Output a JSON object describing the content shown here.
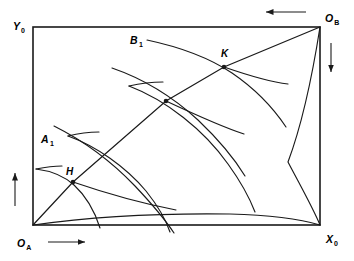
{
  "figure": {
    "type": "edgeworth-box-diagram",
    "title": "",
    "background_color": "#ffffff",
    "line_color": "#1a1a1a",
    "box": {
      "left": 33,
      "top": 27,
      "right": 320,
      "bottom": 225,
      "width": 287,
      "height": 198
    },
    "axis_labels": [
      {
        "id": "y-axis-label",
        "base": "Y",
        "sub": "0",
        "x": 13,
        "y": 27,
        "anchor": "start"
      },
      {
        "id": "ob-label",
        "base": "O",
        "sub": "B",
        "x": 325,
        "y": 22,
        "anchor": "start"
      },
      {
        "id": "oa-label",
        "base": "O",
        "sub": "A",
        "x": 17,
        "y": 247,
        "anchor": "start"
      },
      {
        "id": "x-axis-label",
        "base": "X",
        "sub": "0",
        "x": 326,
        "y": 243,
        "anchor": "start"
      }
    ],
    "point_labels": [
      {
        "id": "label-K",
        "text": "K",
        "x": 221,
        "y": 57
      },
      {
        "id": "label-H",
        "text": "H",
        "x": 66,
        "y": 175
      }
    ],
    "curve_labels": [
      {
        "id": "label-B1",
        "base": "B",
        "sub": "1",
        "x": 130,
        "y": 44
      },
      {
        "id": "label-A1",
        "base": "A",
        "sub": "1",
        "x": 41,
        "y": 143
      }
    ],
    "direction_arrows": [
      {
        "id": "arrow-top-left",
        "direction": "left",
        "x1": 305,
        "y1": 12,
        "x2": 265,
        "y2": 12
      },
      {
        "id": "arrow-right-down",
        "direction": "down",
        "x1": 331,
        "y1": 43,
        "x2": 331,
        "y2": 73
      },
      {
        "id": "arrow-left-up",
        "direction": "up",
        "x1": 15,
        "y1": 206,
        "x2": 15,
        "y2": 172
      },
      {
        "id": "arrow-bottom-right",
        "direction": "right",
        "x1": 48,
        "y1": 242,
        "x2": 86,
        "y2": 242
      }
    ],
    "equilibrium_points": [
      {
        "id": "point-H",
        "label": "H",
        "x": 73,
        "y": 182
      },
      {
        "id": "point-mid",
        "label": "",
        "x": 166,
        "y": 101
      },
      {
        "id": "point-K",
        "label": "K",
        "x": 224,
        "y": 67
      }
    ],
    "contract_curve": {
      "id": "contract-curve",
      "description": "contract curve from O_A to O_B through H, mid, K",
      "path": "M 33 225 L 73 182 L 166 101 L 224 67 L 320 27"
    },
    "isoquants_A": [
      {
        "id": "isoquant-A1",
        "label": "A1",
        "path": "M 37 170 C 55 175 68 180 78 191 C 88 202 96 214 101 228"
      },
      {
        "id": "isoquant-A2",
        "path": "M 70 137 C 100 147 128 167 147 192 C 158 206 166 220 170 232"
      },
      {
        "id": "isoquant-A3",
        "path": "M 130 87 C 170 101 208 131 232 166 C 244 183 253 200 258 214"
      }
    ],
    "isoquants_B": [
      {
        "id": "isoquant-B1",
        "label": "B1",
        "path": "M 148 40 C 185 49 215 62 240 80 C 262 96 280 114 295 135"
      },
      {
        "id": "isoquant-B2",
        "path": "M 116 69 C 150 84 180 104 202 126 C 220 144 235 162 246 180"
      },
      {
        "id": "isoquant-B3",
        "path": "M 57 128 C 88 145 117 167 139 189 C 155 205 168 221 176 233"
      }
    ],
    "envelope_curves": [
      {
        "id": "envelope-lower",
        "description": "lower boundary curve from O_A to X_0",
        "path": "M 33 225 C 90 217 160 213 230 214 C 270 215 300 219 320 225"
      },
      {
        "id": "envelope-upper",
        "description": "upper boundary curve from O_B to X_0",
        "path": "M 320 27 C 310 80 297 135 285 170 C 310 200 316 215 320 225"
      }
    ],
    "isoquant_tails": [
      {
        "id": "tail-A1-upper",
        "path": "M 37 170 C 45 168 52 167 58 167"
      },
      {
        "id": "tail-A2-upper",
        "path": "M 70 137 C 78 135 84 134 90 134"
      },
      {
        "id": "tail-A3-upper",
        "path": "M 130 87 C 138 85 144 84 150 84"
      }
    ]
  }
}
